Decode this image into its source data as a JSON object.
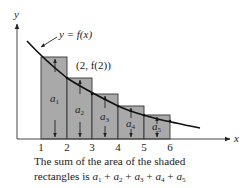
{
  "figure": {
    "axis_labels": {
      "x": "x",
      "y": "y"
    },
    "curve_label": "y = f(x)",
    "point_label": "(2, f(2))",
    "tick_labels": [
      "1",
      "2",
      "3",
      "4",
      "5",
      "6"
    ],
    "rectangles": [
      {
        "label": "a",
        "sub": "1",
        "x_from": 1,
        "x_to": 2,
        "height_at": 2
      },
      {
        "label": "a",
        "sub": "2",
        "x_from": 2,
        "x_to": 3,
        "height_at": 3
      },
      {
        "label": "a",
        "sub": "3",
        "x_from": 3,
        "x_to": 4,
        "height_at": 4
      },
      {
        "label": "a",
        "sub": "4",
        "x_from": 4,
        "x_to": 5,
        "height_at": 5
      },
      {
        "label": "a",
        "sub": "5",
        "x_from": 5,
        "x_to": 6,
        "height_at": 6
      }
    ],
    "colors": {
      "shade": "#a9a9a9",
      "line": "#222222",
      "background": "#ffffff"
    }
  },
  "caption": {
    "line1": "The sum of the area of the shaded",
    "line2_prefix": "rectangles is ",
    "terms": [
      {
        "var": "a",
        "sub": "1"
      },
      {
        "var": "a",
        "sub": "2"
      },
      {
        "var": "a",
        "sub": "3"
      },
      {
        "var": "a",
        "sub": "4"
      },
      {
        "var": "a",
        "sub": "5"
      }
    ],
    "operator": "+"
  }
}
